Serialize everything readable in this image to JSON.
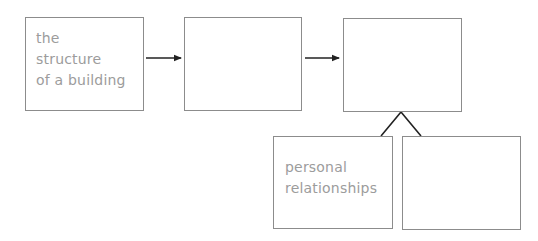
{
  "diagram": {
    "type": "flow",
    "boxes": [
      {
        "id": "box-1",
        "lines": [
          "the",
          "structure",
          "of a building"
        ]
      },
      {
        "id": "box-2",
        "lines": []
      },
      {
        "id": "box-3",
        "lines": []
      },
      {
        "id": "box-4",
        "lines": [
          "personal",
          "relationships"
        ]
      },
      {
        "id": "box-5",
        "lines": []
      }
    ],
    "edges": [
      {
        "from": "box-1",
        "to": "box-2",
        "style": "arrow"
      },
      {
        "from": "box-2",
        "to": "box-3",
        "style": "arrow"
      },
      {
        "from": "box-3",
        "to": "box-4",
        "style": "branch-line"
      },
      {
        "from": "box-3",
        "to": "box-5",
        "style": "branch-line"
      }
    ],
    "colors": {
      "box_border": "#8c8c8c",
      "text": "#9c9c9c",
      "connector": "#222222"
    }
  }
}
